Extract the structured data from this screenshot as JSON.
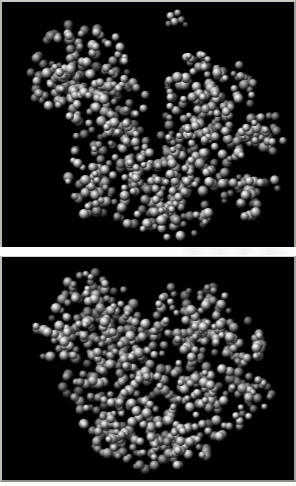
{
  "figure": {
    "panel_count": 2,
    "background_color": "#010101",
    "sheet_color": "#fbfbf9",
    "border_color": "#b8b8b2",
    "atom_color_light": "#f2f2f2",
    "atom_color_mid": "#8d8d8d",
    "atom_color_dark": "#1a1a1a",
    "rendering_style": "CPK space-filling spheres, specular shaded, grayscale",
    "visible_text": ""
  },
  "panels": [
    {
      "id": "panel-top",
      "name": "upper-molecular-view",
      "label": "",
      "view": "bilobed cleft orientation",
      "description": "Grayscale space-filling protein model with a deep central cleft forming a V shape between two lobes; a small detached cluster of atoms floats above the cleft.",
      "has_detached_fragment": true,
      "detached_fragment_atom_count": 6,
      "atom_count_rendered": 720,
      "molecule_bounds": {
        "x": 14,
        "y": 6,
        "width": 266,
        "height": 238
      }
    },
    {
      "id": "panel-bottom",
      "name": "lower-molecular-view",
      "label": "",
      "view": "rotated compact orientation",
      "description": "Grayscale space-filling protein model rotated so the two lobes pack together into a compact globular mass with a shallow notch at the top center.",
      "has_detached_fragment": false,
      "detached_fragment_atom_count": 0,
      "atom_count_rendered": 700,
      "molecule_bounds": {
        "x": 20,
        "y": 16,
        "width": 250,
        "height": 206
      }
    }
  ],
  "chart_data": {
    "type": "scatter",
    "title": "",
    "xlabel": "",
    "ylabel": "",
    "legend": [],
    "grid": false,
    "note": "Two grayscale space-filling (CPK) molecular renderings stacked vertically; no axes, ticks, legend, or text labels are present in the image."
  }
}
